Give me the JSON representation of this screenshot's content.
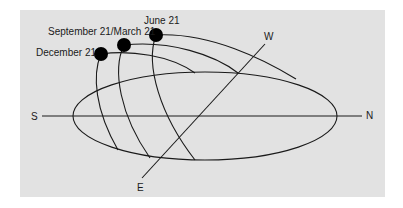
{
  "diagram": {
    "type": "sun-path-diagram",
    "background_color": "#e2e2e2",
    "line_color": "#1a1a1a",
    "directions": {
      "south": "S",
      "north": "N",
      "east": "E",
      "west": "W"
    },
    "paths": [
      {
        "label": "December 21",
        "sun_dot": true
      },
      {
        "label": "September 21/March 21",
        "sun_dot": true
      },
      {
        "label": "June 21",
        "sun_dot": true
      }
    ]
  }
}
